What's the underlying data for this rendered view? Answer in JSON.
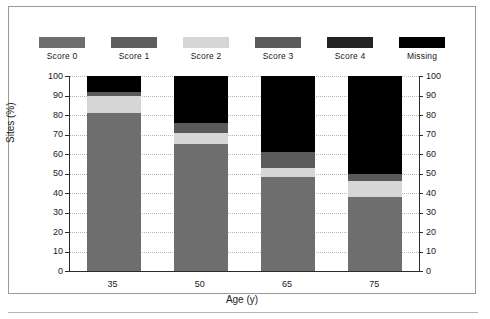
{
  "chart_data": {
    "type": "bar",
    "stacked": true,
    "title": "",
    "xlabel": "Age (y)",
    "ylabel": "Sites (%)",
    "categories": [
      "35",
      "50",
      "65",
      "75"
    ],
    "ylim": [
      0,
      100
    ],
    "yticks": [
      0,
      10,
      20,
      30,
      40,
      50,
      60,
      70,
      80,
      90,
      100
    ],
    "ytick_labels": [
      "0",
      "10",
      "20",
      "30",
      "40",
      "50",
      "60",
      "70",
      "80",
      "90",
      "100"
    ],
    "right_axis": true,
    "grid": "horizontal-dotted",
    "legend_position": "top",
    "series": [
      {
        "name": "Score 0",
        "color": "#6e6e6e",
        "values": [
          81,
          65,
          48,
          38
        ]
      },
      {
        "name": "Score 1",
        "color": "#5e5e5e",
        "values": [
          0,
          0,
          0,
          0
        ]
      },
      {
        "name": "Score 2",
        "color": "#d6d6d6",
        "values": [
          9,
          6,
          5,
          8
        ]
      },
      {
        "name": "Score 3",
        "color": "#5a5a5a",
        "values": [
          2,
          5,
          8,
          4
        ]
      },
      {
        "name": "Score 4",
        "color": "#232323",
        "values": [
          0,
          0,
          0,
          0
        ]
      },
      {
        "name": "Missing",
        "color": "#000000",
        "values": [
          8,
          24,
          39,
          50
        ]
      }
    ]
  },
  "legend": {
    "items": [
      {
        "label": "Score 0",
        "color": "#6e6e6e"
      },
      {
        "label": "Score 1",
        "color": "#5e5e5e"
      },
      {
        "label": "Score 2",
        "color": "#d6d6d6"
      },
      {
        "label": "Score 3",
        "color": "#5a5a5a"
      },
      {
        "label": "Score 4",
        "color": "#232323"
      },
      {
        "label": "Missing",
        "color": "#000000"
      }
    ]
  }
}
